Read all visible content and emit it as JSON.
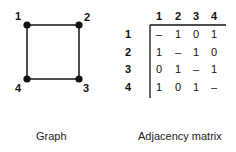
{
  "graph": {
    "caption": "Graph",
    "nodes": [
      {
        "id": "1",
        "label": "1"
      },
      {
        "id": "2",
        "label": "2"
      },
      {
        "id": "3",
        "label": "3"
      },
      {
        "id": "4",
        "label": "4"
      }
    ],
    "edges": [
      [
        "1",
        "2"
      ],
      [
        "2",
        "3"
      ],
      [
        "3",
        "4"
      ],
      [
        "4",
        "1"
      ]
    ]
  },
  "matrix": {
    "caption": "Adjacency matrix",
    "col_headers": [
      "1",
      "2",
      "3",
      "4"
    ],
    "row_headers": [
      "1",
      "2",
      "3",
      "4"
    ],
    "rows": [
      [
        "–",
        "1",
        "0",
        "1"
      ],
      [
        "1",
        "–",
        "1",
        "0"
      ],
      [
        "0",
        "1",
        "–",
        "1"
      ],
      [
        "1",
        "0",
        "1",
        "–"
      ]
    ]
  }
}
